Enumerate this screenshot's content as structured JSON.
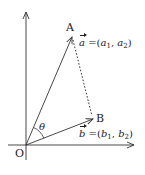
{
  "diagram": {
    "type": "vector-diagram",
    "points": {
      "origin": {
        "label": "O",
        "x": 26,
        "y": 145
      },
      "A": {
        "label": "A",
        "x": 72,
        "y": 37
      },
      "B": {
        "label": "B",
        "x": 93,
        "y": 119
      }
    },
    "vectors": {
      "a": {
        "name": "a",
        "equals": "=",
        "open": "(",
        "c1": "a",
        "c1_sub": "1",
        "sep": ",",
        "c2": "a",
        "c2_sub": "2",
        "close": ")"
      },
      "b": {
        "name": "b",
        "equals": "=",
        "open": "(",
        "c1": "b",
        "c1_sub": "1",
        "sep": ",",
        "c2": "b",
        "c2_sub": "2",
        "close": ")"
      }
    },
    "angle_label": "θ",
    "colors": {
      "stroke": "#333333",
      "text": "#222222",
      "background": "#ffffff"
    }
  }
}
